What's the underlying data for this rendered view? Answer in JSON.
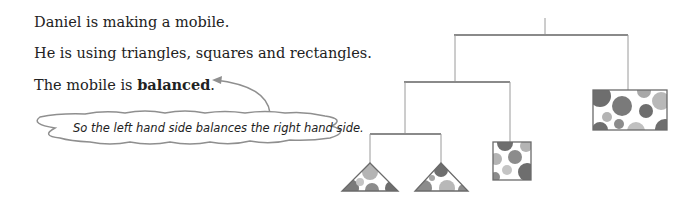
{
  "text": {
    "line1": "Daniel is making a mobile.",
    "line2": "He is using triangles, squares and rectangles.",
    "line3_prefix": "The mobile is ",
    "line3_bold": "balanced",
    "line3_suffix": "."
  },
  "thought_cloud": {
    "text": "So the left hand side balances the right hand side."
  },
  "mobile": {
    "shapes": [
      "triangle",
      "triangle",
      "square",
      "rectangle"
    ],
    "colors": {
      "bar": "#8a8a8a",
      "string": "#9a9a9a",
      "dot_dark": "#6e6e6e",
      "dot_mid": "#8c8c8c",
      "dot_light": "#b4b4b4"
    }
  }
}
